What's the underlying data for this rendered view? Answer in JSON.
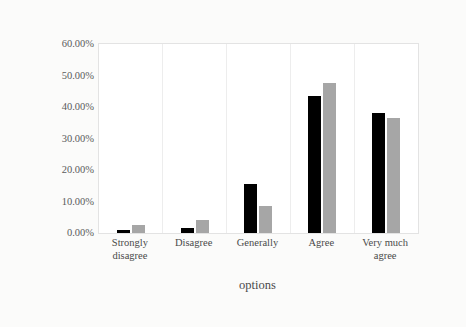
{
  "chart_data": {
    "type": "bar",
    "title": "",
    "xlabel": "options",
    "ylabel": "proportion",
    "categories": [
      "Strongly disagree",
      "Disagree",
      "Generally",
      "Agree",
      "Very much agree"
    ],
    "series": [
      {
        "name": "series-1",
        "color": "#000000",
        "values": [
          1.0,
          1.7,
          15.5,
          43.5,
          38.0
        ]
      },
      {
        "name": "series-2",
        "color": "#a6a6a6",
        "values": [
          2.5,
          4.0,
          8.5,
          47.5,
          36.5
        ]
      }
    ],
    "ylim": [
      0,
      60
    ],
    "yticks": [
      0,
      10,
      20,
      30,
      40,
      50,
      60
    ],
    "ytick_labels": [
      "0.00%",
      "10.00%",
      "20.00%",
      "30.00%",
      "40.00%",
      "50.00%",
      "60.00%"
    ],
    "grid": "vertical",
    "legend": "none",
    "value_format": "percent"
  },
  "axes": {
    "y_title": "proportion",
    "x_title": "options"
  },
  "colors": {
    "series_1": "#000000",
    "series_2": "#a6a6a6",
    "plot_background": "#ffffff",
    "gridline": "#ededed",
    "axis_text": "#4a4a4a",
    "page_background": "#fbfbfa"
  }
}
